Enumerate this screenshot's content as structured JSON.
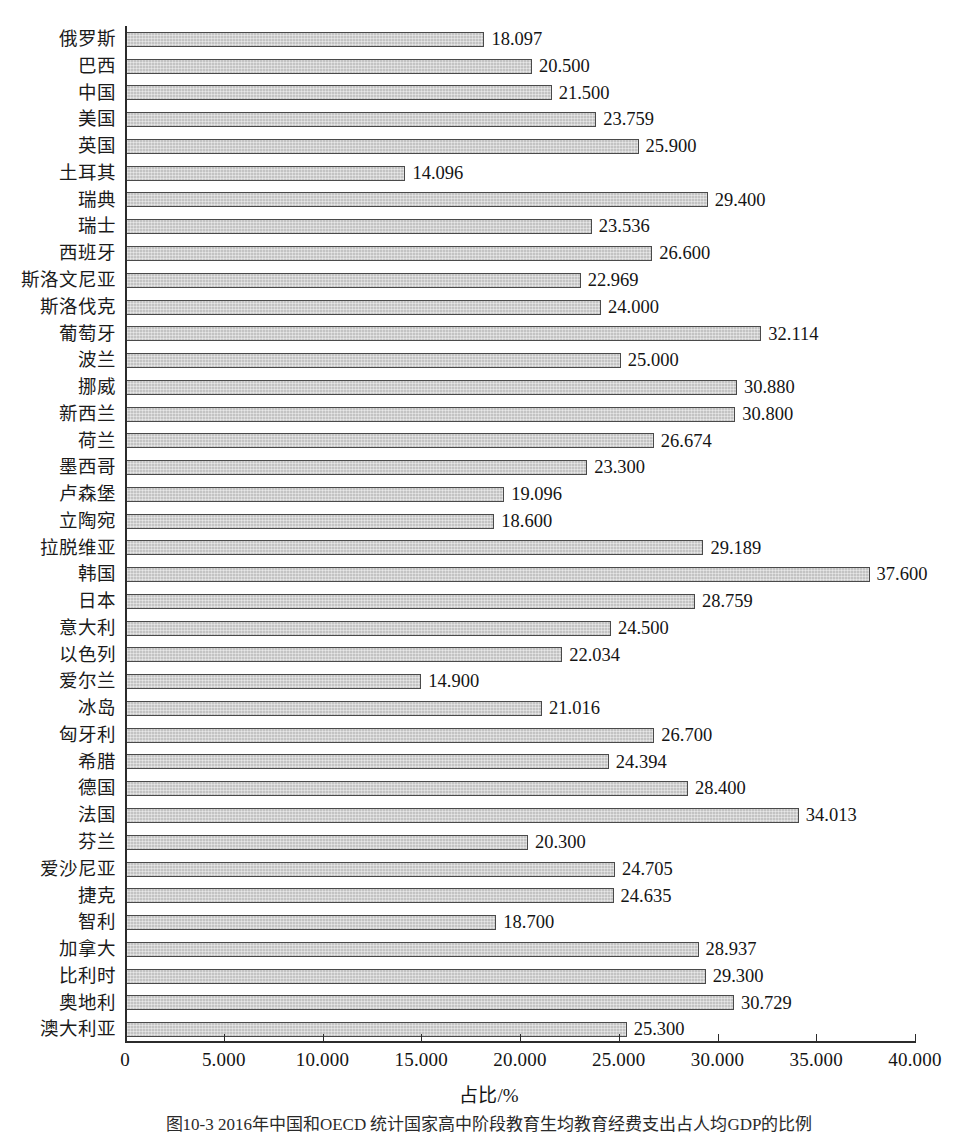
{
  "chart_data": {
    "type": "bar",
    "orientation": "horizontal",
    "title": "",
    "xlabel": "占比/%",
    "ylabel": "",
    "xlim": [
      0,
      40
    ],
    "xticks": [
      "0",
      "5.000",
      "10.000",
      "15.000",
      "20.000",
      "25.000",
      "30.000",
      "35.000",
      "40.000"
    ],
    "xtick_values": [
      0,
      5,
      10,
      15,
      20,
      25,
      30,
      35,
      40
    ],
    "grid": false,
    "legend": null,
    "bar_color": "#c3c3c3",
    "bar_edge_color": "#4a4a4a",
    "value_label_format": "0.000",
    "categories": [
      "俄罗斯",
      "巴西",
      "中国",
      "美国",
      "英国",
      "土耳其",
      "瑞典",
      "瑞士",
      "西班牙",
      "斯洛文尼亚",
      "斯洛伐克",
      "葡萄牙",
      "波兰",
      "挪威",
      "新西兰",
      "荷兰",
      "墨西哥",
      "卢森堡",
      "立陶宛",
      "拉脱维亚",
      "韩国",
      "日本",
      "意大利",
      "以色列",
      "爱尔兰",
      "冰岛",
      "匈牙利",
      "希腊",
      "德国",
      "法国",
      "芬兰",
      "爱沙尼亚",
      "捷克",
      "智利",
      "加拿大",
      "比利时",
      "奥地利",
      "澳大利亚"
    ],
    "values": [
      18.097,
      20.5,
      21.5,
      23.759,
      25.9,
      14.096,
      29.4,
      23.536,
      26.6,
      22.969,
      24.0,
      32.114,
      25.0,
      30.88,
      30.8,
      26.674,
      23.3,
      19.096,
      18.6,
      29.189,
      37.6,
      28.759,
      24.5,
      22.034,
      14.9,
      21.016,
      26.7,
      24.394,
      28.4,
      34.013,
      20.3,
      24.705,
      24.635,
      18.7,
      28.937,
      29.3,
      30.729,
      25.3
    ],
    "value_labels": [
      "18.097",
      "20.500",
      "21.500",
      "23.759",
      "25.900",
      "14.096",
      "29.400",
      "23.536",
      "26.600",
      "22.969",
      "24.000",
      "32.114",
      "25.000",
      "30.880",
      "30.800",
      "26.674",
      "23.300",
      "19.096",
      "18.600",
      "29.189",
      "37.600",
      "28.759",
      "24.500",
      "22.034",
      "14.900",
      "21.016",
      "26.700",
      "24.394",
      "28.400",
      "34.013",
      "20.300",
      "24.705",
      "24.635",
      "18.700",
      "28.937",
      "29.300",
      "30.729",
      "25.300"
    ]
  },
  "axis": {
    "x_title": "占比/%"
  },
  "caption": {
    "text": "图10-3  2016年中国和OECD 统计国家高中阶段教育生均教育经费支出占人均GDP的比例"
  }
}
